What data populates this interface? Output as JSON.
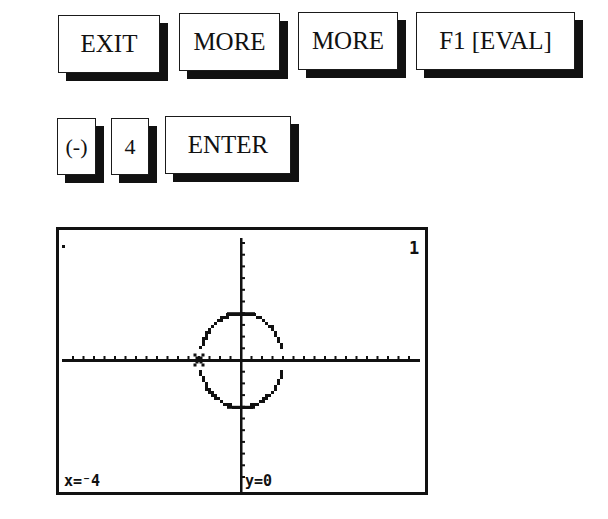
{
  "keys_row1": [
    {
      "label": "EXIT",
      "name": "exit-key"
    },
    {
      "label": "MORE",
      "name": "more-key-1"
    },
    {
      "label": "MORE",
      "name": "more-key-2"
    },
    {
      "label": "F1 [EVAL]",
      "name": "f1-eval-key"
    }
  ],
  "keys_row2": [
    {
      "label": "(-)",
      "name": "negative-key"
    },
    {
      "label": "4",
      "name": "four-key"
    },
    {
      "label": "ENTER",
      "name": "enter-key"
    }
  ],
  "screen": {
    "busy_indicator": "1",
    "cursor_x_readout": "x=⁻4",
    "cursor_y_readout": "y=0",
    "cursor": {
      "x": -4,
      "y": 0
    },
    "colors": {
      "pixel": "#111111",
      "background": "#ffffff"
    }
  },
  "chart_data": {
    "type": "line",
    "title": "",
    "xlabel": "",
    "ylabel": "",
    "xlim": [
      -17,
      17
    ],
    "ylim": [
      -11,
      11
    ],
    "grid": false,
    "tick_spacing": 1,
    "series": [
      {
        "name": "upper semicircle y=√(16−x²)",
        "x": [
          -4,
          -3,
          -2,
          -1,
          0,
          1,
          2,
          3,
          4
        ],
        "y": [
          0,
          2.65,
          3.46,
          3.87,
          4,
          3.87,
          3.46,
          2.65,
          0
        ]
      },
      {
        "name": "lower semicircle y=−√(16−x²)",
        "x": [
          -4,
          -3,
          -2,
          -1,
          0,
          1,
          2,
          3,
          4
        ],
        "y": [
          0,
          -2.65,
          -3.46,
          -3.87,
          -4,
          -3.87,
          -3.46,
          -2.65,
          0
        ]
      }
    ],
    "annotations": [
      "cursor at x=-4, y=0"
    ]
  }
}
